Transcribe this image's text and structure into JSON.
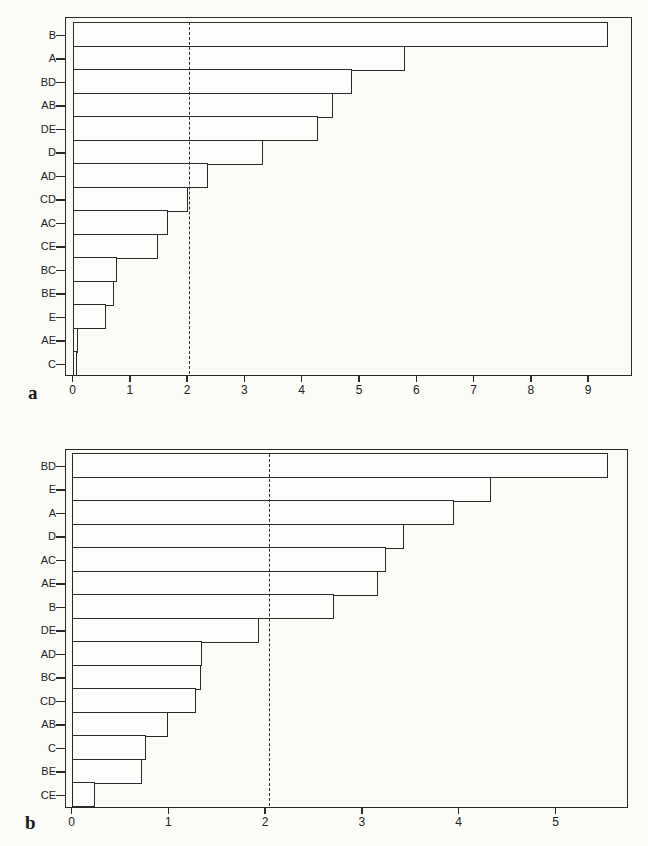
{
  "chart_data": [
    {
      "type": "bar",
      "orientation": "horizontal",
      "panel_label": "a",
      "title": "",
      "xlabel": "",
      "ylabel": "",
      "categories": [
        "B",
        "A",
        "BD",
        "AB",
        "DE",
        "D",
        "AD",
        "CD",
        "AC",
        "CE",
        "BC",
        "BE",
        "E",
        "AE",
        "C"
      ],
      "values": [
        9.35,
        5.81,
        4.87,
        4.54,
        4.28,
        3.33,
        2.36,
        2.01,
        1.66,
        1.5,
        0.77,
        0.73,
        0.59,
        0.1,
        0.07
      ],
      "xticks": [
        "0",
        "1",
        "2",
        "3",
        "4",
        "5",
        "6",
        "7",
        "8",
        "9"
      ],
      "xlim": [
        -0.1,
        9.7
      ],
      "reference_line": {
        "value": 2.04,
        "style": "dashed"
      },
      "grid": false,
      "legend": null
    },
    {
      "type": "bar",
      "orientation": "horizontal",
      "panel_label": "b",
      "title": "",
      "xlabel": "",
      "ylabel": "",
      "categories": [
        "BD",
        "E",
        "A",
        "D",
        "AC",
        "AE",
        "B",
        "DE",
        "AD",
        "BC",
        "CD",
        "AB",
        "C",
        "BE",
        "CE"
      ],
      "values": [
        5.54,
        4.33,
        3.95,
        3.43,
        3.25,
        3.17,
        2.71,
        1.94,
        1.35,
        1.34,
        1.29,
        1.0,
        0.77,
        0.73,
        0.24
      ],
      "xticks": [
        "0",
        "1",
        "2",
        "3",
        "4",
        "5"
      ],
      "xlim": [
        -0.06,
        5.8
      ],
      "reference_line": {
        "value": 2.04,
        "style": "dashed"
      },
      "grid": false,
      "legend": null
    }
  ]
}
